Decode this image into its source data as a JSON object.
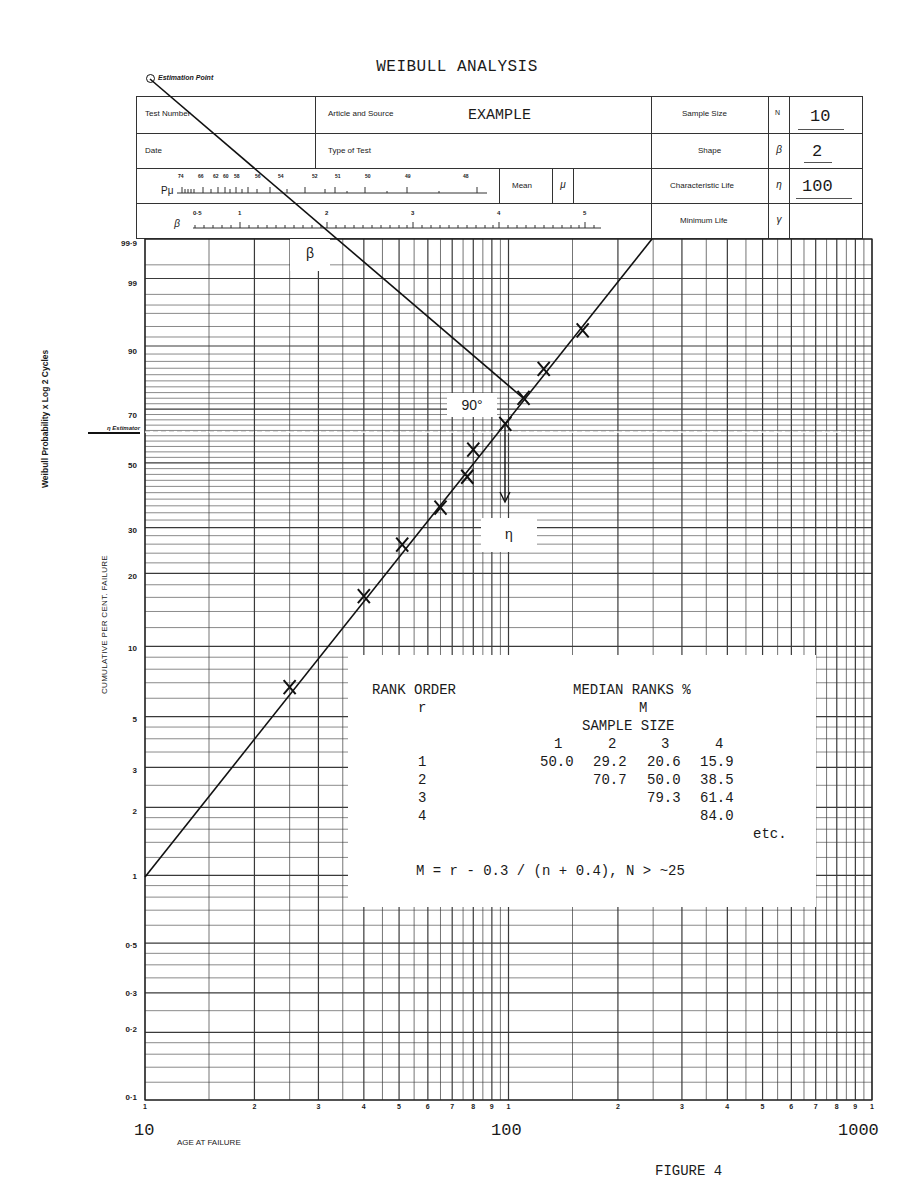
{
  "title": "WEIBULL ANALYSIS",
  "estimation_point_label": "Estimation Point",
  "figure_label": "FIGURE 4",
  "header_form": {
    "test_number_label": "Test Number",
    "article_source_label": "Article and Source",
    "article_source_value": "EXAMPLE",
    "date_label": "Date",
    "type_of_test_label": "Type of Test",
    "p_mu_label": "Pμ",
    "p_mu_scale": [
      "74",
      "66",
      "62",
      "60",
      "58",
      "56",
      "54",
      "52",
      "51",
      "50",
      "49",
      "48"
    ],
    "mean_label": "Mean",
    "mean_symbol": "μ",
    "beta_scale_symbol": "β",
    "beta_scale": [
      "0·5",
      "1",
      "2",
      "3",
      "4",
      "5"
    ],
    "sample_size_label": "Sample Size",
    "sample_size_symbol": "N",
    "sample_size_value": "10",
    "shape_label": "Shape",
    "shape_symbol": "β",
    "shape_value": "2",
    "char_life_label": "Characteristic Life",
    "char_life_symbol": "η",
    "char_life_value": "100",
    "min_life_label": "Minimum Life",
    "min_life_symbol": "γ",
    "min_life_value": ""
  },
  "annotations": {
    "beta_marker": "β",
    "angle_marker": "90°",
    "eta_marker": "η",
    "eta_estimator_label": "η Estimator",
    "side_title": "Weibull Probability x Log 2 Cycles",
    "y_axis_title": "CUMULATIVE PER CENT. FAILURE",
    "x_axis_title": "AGE AT FAILURE"
  },
  "rank_table": {
    "heading_left": "RANK ORDER",
    "heading_left_sub": "r",
    "heading_right": "MEDIAN RANKS %",
    "heading_right_sub": "M",
    "sample_size_heading": "SAMPLE SIZE",
    "columns": [
      "1",
      "2",
      "3",
      "4"
    ],
    "rows": [
      {
        "r": "1",
        "values": [
          "50.0",
          "29.2",
          "20.6",
          "15.9"
        ]
      },
      {
        "r": "2",
        "values": [
          "",
          "70.7",
          "50.0",
          "38.5"
        ]
      },
      {
        "r": "3",
        "values": [
          "",
          "",
          "79.3",
          "61.4"
        ]
      },
      {
        "r": "4",
        "values": [
          "",
          "",
          "",
          "84.0"
        ]
      }
    ],
    "etc": "etc.",
    "formula": "M = r - 0.3 / (n + 0.4), N > ~25"
  },
  "chart_data": {
    "type": "scatter",
    "title": "WEIBULL ANALYSIS",
    "xlabel": "AGE AT FAILURE",
    "ylabel": "CUMULATIVE PER CENT. FAILURE",
    "x_scale": "log",
    "y_scale": "weibull",
    "xlim": [
      10,
      1000
    ],
    "ylim": [
      0.1,
      99.9
    ],
    "x_major_ticks": [
      "10",
      "100",
      "1000"
    ],
    "x_minor_tick_labels": [
      "1",
      "2",
      "3",
      "4",
      "5",
      "6",
      "7",
      "8",
      "9",
      "1",
      "2",
      "3",
      "4",
      "5",
      "6",
      "7",
      "8",
      "9",
      "1"
    ],
    "y_ticks": [
      "0·1",
      "0·2",
      "0·3",
      "0·5",
      "1",
      "2",
      "3",
      "5",
      "10",
      "20",
      "30",
      "50",
      "70",
      "90",
      "99",
      "99·9"
    ],
    "grid": true,
    "series": [
      {
        "name": "Failures (N=10)",
        "marker": "x",
        "x": [
          25,
          40,
          51,
          65,
          77,
          80,
          98,
          110,
          125,
          160
        ],
        "y": [
          6.7,
          16.2,
          25.9,
          35.5,
          45.2,
          54.8,
          64.5,
          74.1,
          83.8,
          93.3
        ]
      },
      {
        "name": "Fitted line (β=2, η=100)",
        "type": "line",
        "x": [
          10,
          250
        ],
        "y": [
          1.0,
          99.9
        ]
      }
    ],
    "annotations": {
      "shape_beta": 2,
      "characteristic_life_eta": 100,
      "eta_estimator_percent": 63.2,
      "sample_size": 10
    }
  }
}
